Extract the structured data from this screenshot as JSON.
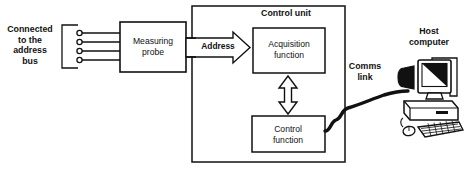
{
  "diagram": {
    "type": "block-diagram",
    "colors": {
      "stroke": "#111111",
      "background": "#ffffff",
      "fill": "#ffffff"
    },
    "labels": {
      "address_bus": "Connected\nto the\naddress\nbus",
      "measuring_probe": "Measuring\nprobe",
      "address": "Address",
      "control_unit": "Control unit",
      "acquisition_function": "Acquisition\nfunction",
      "control_function": "Control\nfunction",
      "comms_link": "Comms\nlink",
      "host_computer": "Host\ncomputer"
    },
    "connector": {
      "name": "address-bus-connector",
      "pin_count": 4,
      "style": "bracket-with-circles"
    },
    "arrows": {
      "address": {
        "direction": "right",
        "style": "block-arrow"
      },
      "acquisition_control": {
        "direction": "both",
        "style": "double-headed-block-arrow"
      }
    },
    "comms_cable": {
      "style": "thick-wavy-line"
    }
  }
}
